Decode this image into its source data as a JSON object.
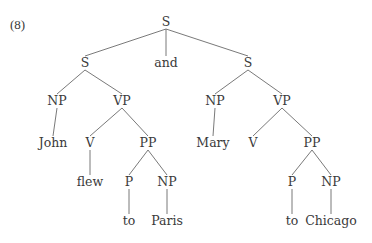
{
  "example_number": "(8)",
  "colors": {
    "text": "#3a3a3a",
    "edge": "#6a6a6a",
    "background": "#ffffff"
  },
  "nodes": [
    {
      "id": "s_root",
      "label": "S",
      "x": 166,
      "y": 22
    },
    {
      "id": "s_left",
      "label": "S",
      "x": 85,
      "y": 63
    },
    {
      "id": "and",
      "label": "and",
      "x": 166,
      "y": 63
    },
    {
      "id": "s_right",
      "label": "S",
      "x": 248,
      "y": 63
    },
    {
      "id": "np_l",
      "label": "NP",
      "x": 57,
      "y": 101
    },
    {
      "id": "vp_l",
      "label": "VP",
      "x": 122,
      "y": 101
    },
    {
      "id": "np_r",
      "label": "NP",
      "x": 215,
      "y": 101
    },
    {
      "id": "vp_r",
      "label": "VP",
      "x": 282,
      "y": 101
    },
    {
      "id": "john",
      "label": "John",
      "x": 53,
      "y": 143
    },
    {
      "id": "v_l",
      "label": "V",
      "x": 90,
      "y": 143
    },
    {
      "id": "pp_l",
      "label": "PP",
      "x": 148,
      "y": 143
    },
    {
      "id": "mary",
      "label": "Mary",
      "x": 213,
      "y": 143
    },
    {
      "id": "v_r",
      "label": "V",
      "x": 253,
      "y": 143
    },
    {
      "id": "pp_r",
      "label": "PP",
      "x": 312,
      "y": 143
    },
    {
      "id": "flew",
      "label": "flew",
      "x": 90,
      "y": 182
    },
    {
      "id": "p_l",
      "label": "P",
      "x": 129,
      "y": 182
    },
    {
      "id": "np2_l",
      "label": "NP",
      "x": 167,
      "y": 182
    },
    {
      "id": "p_r",
      "label": "P",
      "x": 292,
      "y": 182
    },
    {
      "id": "np2_r",
      "label": "NP",
      "x": 331,
      "y": 182
    },
    {
      "id": "to_l",
      "label": "to",
      "x": 129,
      "y": 221
    },
    {
      "id": "paris",
      "label": "Paris",
      "x": 167,
      "y": 221
    },
    {
      "id": "to_r",
      "label": "to",
      "x": 292,
      "y": 221
    },
    {
      "id": "chicago",
      "label": "Chicago",
      "x": 331,
      "y": 221
    }
  ],
  "edges": [
    [
      "s_root",
      "s_left"
    ],
    [
      "s_root",
      "and"
    ],
    [
      "s_root",
      "s_right"
    ],
    [
      "s_left",
      "np_l"
    ],
    [
      "s_left",
      "vp_l"
    ],
    [
      "s_right",
      "np_r"
    ],
    [
      "s_right",
      "vp_r"
    ],
    [
      "np_l",
      "john"
    ],
    [
      "vp_l",
      "v_l"
    ],
    [
      "vp_l",
      "pp_l"
    ],
    [
      "np_r",
      "mary"
    ],
    [
      "vp_r",
      "v_r"
    ],
    [
      "vp_r",
      "pp_r"
    ],
    [
      "v_l",
      "flew"
    ],
    [
      "pp_l",
      "p_l"
    ],
    [
      "pp_l",
      "np2_l"
    ],
    [
      "pp_r",
      "p_r"
    ],
    [
      "pp_r",
      "np2_r"
    ],
    [
      "p_l",
      "to_l"
    ],
    [
      "np2_l",
      "paris"
    ],
    [
      "p_r",
      "to_r"
    ],
    [
      "np2_r",
      "chicago"
    ]
  ]
}
